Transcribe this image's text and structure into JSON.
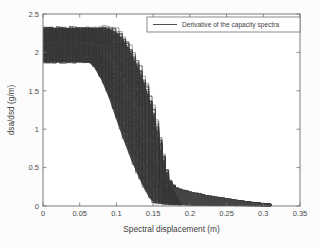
{
  "figure": {
    "background_color": "#fcfcfc",
    "plot_box": {
      "left": 43,
      "top": 14,
      "right": 300,
      "bottom": 206
    },
    "axis_color": "#6e6e6e",
    "curve_color": "#3a3a3a"
  },
  "chart_data": {
    "type": "line",
    "title": "",
    "xlabel": "Spectral displacement (m)",
    "ylabel": "dsa/dsd (g/m)",
    "xlim": [
      0,
      0.35
    ],
    "ylim": [
      0,
      2.5
    ],
    "xticks": [
      0,
      0.05,
      0.1,
      0.15,
      0.2,
      0.25,
      0.3,
      0.35
    ],
    "xticklabels": [
      "0",
      "0.05",
      "0.1",
      "0.15",
      "0.2",
      "0.25",
      "0.3",
      "0.35"
    ],
    "yticks": [
      0,
      0.5,
      1,
      1.5,
      2,
      2.5
    ],
    "yticklabels": [
      "0",
      "0.5",
      "1",
      "1.5",
      "2",
      "2.5"
    ],
    "grid": false,
    "legend": {
      "position": "upper-right",
      "entries": [
        {
          "label": "Derivative of the capacity spectra",
          "color": "#3d3d3d",
          "style": "solid"
        }
      ]
    },
    "band": {
      "upper_envelope": [
        {
          "x": 0.0,
          "y": 2.32
        },
        {
          "x": 0.02,
          "y": 2.32
        },
        {
          "x": 0.04,
          "y": 2.32
        },
        {
          "x": 0.06,
          "y": 2.32
        },
        {
          "x": 0.08,
          "y": 2.32
        },
        {
          "x": 0.09,
          "y": 2.31
        },
        {
          "x": 0.1,
          "y": 2.27
        },
        {
          "x": 0.11,
          "y": 2.16
        },
        {
          "x": 0.12,
          "y": 2.0
        },
        {
          "x": 0.13,
          "y": 1.8
        },
        {
          "x": 0.14,
          "y": 1.55
        },
        {
          "x": 0.15,
          "y": 1.22
        },
        {
          "x": 0.155,
          "y": 1.0
        },
        {
          "x": 0.16,
          "y": 0.74
        },
        {
          "x": 0.165,
          "y": 0.52
        },
        {
          "x": 0.17,
          "y": 0.34
        },
        {
          "x": 0.178,
          "y": 0.24
        },
        {
          "x": 0.19,
          "y": 0.2
        },
        {
          "x": 0.205,
          "y": 0.17
        },
        {
          "x": 0.225,
          "y": 0.13
        },
        {
          "x": 0.245,
          "y": 0.1
        },
        {
          "x": 0.265,
          "y": 0.07
        },
        {
          "x": 0.285,
          "y": 0.045
        },
        {
          "x": 0.3,
          "y": 0.03
        },
        {
          "x": 0.311,
          "y": 0.02
        }
      ],
      "lower_envelope": [
        {
          "x": 0.0,
          "y": 1.87
        },
        {
          "x": 0.02,
          "y": 1.87
        },
        {
          "x": 0.04,
          "y": 1.87
        },
        {
          "x": 0.062,
          "y": 1.87
        },
        {
          "x": 0.066,
          "y": 1.84
        },
        {
          "x": 0.07,
          "y": 1.8
        },
        {
          "x": 0.08,
          "y": 1.63
        },
        {
          "x": 0.09,
          "y": 1.4
        },
        {
          "x": 0.1,
          "y": 1.12
        },
        {
          "x": 0.11,
          "y": 0.85
        },
        {
          "x": 0.12,
          "y": 0.6
        },
        {
          "x": 0.13,
          "y": 0.38
        },
        {
          "x": 0.138,
          "y": 0.22
        },
        {
          "x": 0.145,
          "y": 0.1
        },
        {
          "x": 0.152,
          "y": 0.04
        },
        {
          "x": 0.165,
          "y": 0.02
        },
        {
          "x": 0.19,
          "y": 0.012
        },
        {
          "x": 0.23,
          "y": 0.008
        },
        {
          "x": 0.27,
          "y": 0.005
        },
        {
          "x": 0.311,
          "y": 0.0
        }
      ]
    },
    "sample_curves": [
      {
        "name": "curve-low-1",
        "points": [
          [
            0,
            1.88
          ],
          [
            0.063,
            1.88
          ],
          [
            0.066,
            1.86
          ],
          [
            0.068,
            1.82
          ],
          [
            0.075,
            1.7
          ],
          [
            0.085,
            1.48
          ],
          [
            0.095,
            1.22
          ],
          [
            0.105,
            0.95
          ],
          [
            0.115,
            0.7
          ],
          [
            0.125,
            0.48
          ],
          [
            0.133,
            0.3
          ],
          [
            0.141,
            0.16
          ],
          [
            0.148,
            0.07
          ],
          [
            0.158,
            0.03
          ],
          [
            0.185,
            0.02
          ],
          [
            0.25,
            0.01
          ],
          [
            0.31,
            0.0
          ]
        ]
      },
      {
        "name": "curve-mid-1",
        "points": [
          [
            0,
            2.05
          ],
          [
            0.07,
            2.05
          ],
          [
            0.08,
            2.03
          ],
          [
            0.09,
            1.95
          ],
          [
            0.1,
            1.78
          ],
          [
            0.11,
            1.55
          ],
          [
            0.12,
            1.28
          ],
          [
            0.13,
            1.0
          ],
          [
            0.14,
            0.7
          ],
          [
            0.148,
            0.45
          ],
          [
            0.155,
            0.25
          ],
          [
            0.162,
            0.12
          ],
          [
            0.172,
            0.06
          ],
          [
            0.2,
            0.04
          ],
          [
            0.26,
            0.02
          ],
          [
            0.31,
            0.01
          ]
        ]
      },
      {
        "name": "curve-mid-2",
        "points": [
          [
            0,
            2.18
          ],
          [
            0.085,
            2.18
          ],
          [
            0.095,
            2.14
          ],
          [
            0.105,
            2.02
          ],
          [
            0.115,
            1.84
          ],
          [
            0.125,
            1.6
          ],
          [
            0.135,
            1.3
          ],
          [
            0.145,
            0.98
          ],
          [
            0.152,
            0.7
          ],
          [
            0.159,
            0.45
          ],
          [
            0.166,
            0.27
          ],
          [
            0.175,
            0.17
          ],
          [
            0.19,
            0.13
          ],
          [
            0.23,
            0.09
          ],
          [
            0.27,
            0.05
          ],
          [
            0.31,
            0.02
          ]
        ]
      },
      {
        "name": "curve-high-1",
        "points": [
          [
            0,
            2.31
          ],
          [
            0.09,
            2.31
          ],
          [
            0.1,
            2.27
          ],
          [
            0.11,
            2.16
          ],
          [
            0.12,
            2.0
          ],
          [
            0.13,
            1.79
          ],
          [
            0.14,
            1.53
          ],
          [
            0.15,
            1.2
          ],
          [
            0.157,
            0.92
          ],
          [
            0.163,
            0.64
          ],
          [
            0.169,
            0.4
          ],
          [
            0.176,
            0.26
          ],
          [
            0.19,
            0.2
          ],
          [
            0.22,
            0.15
          ],
          [
            0.26,
            0.08
          ],
          [
            0.3,
            0.035
          ],
          [
            0.311,
            0.02
          ]
        ]
      }
    ]
  }
}
